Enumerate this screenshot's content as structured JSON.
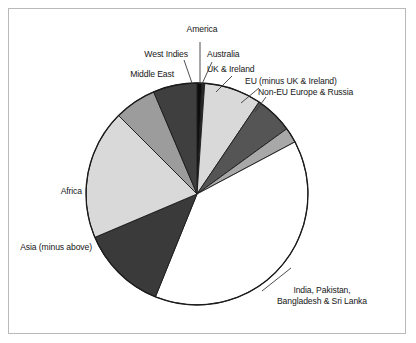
{
  "figure": {
    "background": "#ffffff",
    "frame_color": "#b9b9b9",
    "text_color": "#161616",
    "leader_color": "#3b3b3b"
  },
  "chart_data": {
    "type": "pie",
    "title": "",
    "xlabel": "",
    "ylabel": "",
    "legend_position": "none",
    "grid": false,
    "start_angle_deg": 0,
    "direction": "clockwise",
    "center_px": [
      197,
      194
    ],
    "radius_px": 111,
    "categories": [
      "America",
      "Australia",
      "UK & Ireland",
      "EU (minus UK & Ireland)",
      "Non-EU Europe & Russia",
      "India, Pakistan, Bangladesh & Sri Lanka",
      "Asia (minus above)",
      "Africa",
      "Middle East",
      "West Indies"
    ],
    "values": [
      0.7,
      0.4,
      8.3,
      5.6,
      2.2,
      38.9,
      12.5,
      18.9,
      6.1,
      3.6
    ],
    "value_unit": "percent",
    "colors": [
      "#0d0d0d",
      "#2a2a2a",
      "#d9d9d9",
      "#555555",
      "#a8a8a8",
      "#ffffff",
      "#3a3a3a",
      "#d9d9d9",
      "#9c9c9c",
      "#3f3f3f"
    ],
    "slice_angles_deg": [
      [
        0,
        2.5
      ],
      [
        2.5,
        4.0
      ],
      [
        4.0,
        34.0
      ],
      [
        34.0,
        54.0
      ],
      [
        54.0,
        62.0
      ],
      [
        62.0,
        202.0
      ],
      [
        202.0,
        247.0
      ],
      [
        247.0,
        315.0
      ],
      [
        315.0,
        337.0
      ],
      [
        337.0,
        360.0
      ]
    ]
  },
  "labels": {
    "america": "America",
    "australia": "Australia",
    "uk_ireland": "UK & Ireland",
    "eu": "EU (minus UK & Ireland)",
    "non_eu": "Non-EU Europe & Russia",
    "india_line1": "India, Pakistan,",
    "india_line2": "Bangladesh & Sri Lanka",
    "asia": "Asia (minus above)",
    "africa": "Africa",
    "middle_east": "Middle East",
    "west_indies": "West Indies"
  }
}
